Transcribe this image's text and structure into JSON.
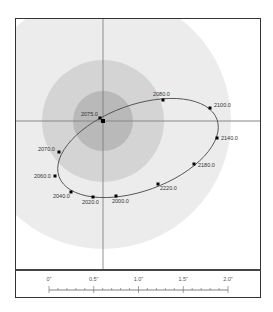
{
  "diagram": {
    "type": "orbit-diagram",
    "center_label": "2075.0",
    "colors": {
      "outer_zone": "#ececec",
      "middle_zone": "#d4d4d4",
      "inner_zone": "#b9b9b9",
      "axes": "#777777",
      "orbit": "#555555",
      "points": "#000000",
      "frame": "#333333"
    },
    "zones": [
      {
        "name": "outer",
        "radius_px": 128
      },
      {
        "name": "middle",
        "radius_px": 61
      },
      {
        "name": "inner",
        "radius_px": 30
      }
    ],
    "orbit_points": [
      {
        "label": "2075.0",
        "x": 100,
        "y": 118
      },
      {
        "label": "2080.0",
        "x": 163,
        "y": 100
      },
      {
        "label": "2100.0",
        "x": 210,
        "y": 108
      },
      {
        "label": "2140.0",
        "x": 217,
        "y": 138
      },
      {
        "label": "2180.0",
        "x": 194,
        "y": 164
      },
      {
        "label": "2220.0",
        "x": 158,
        "y": 184
      },
      {
        "label": "2000.0",
        "x": 116,
        "y": 196
      },
      {
        "label": "2020.0",
        "x": 93,
        "y": 197
      },
      {
        "label": "2040.0",
        "x": 71,
        "y": 192
      },
      {
        "label": "2060.0",
        "x": 55,
        "y": 176
      },
      {
        "label": "2070.0",
        "x": 59,
        "y": 152
      }
    ]
  },
  "scale_bar": {
    "ticks": [
      "0\"",
      "0.5\"",
      "1.0\"",
      "1.5\"",
      "2.0\""
    ]
  }
}
